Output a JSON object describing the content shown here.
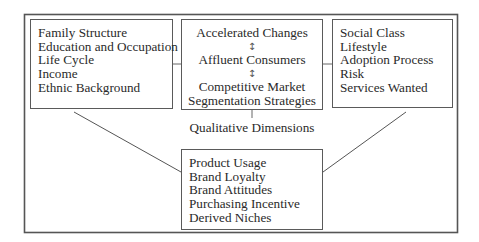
{
  "diagram": {
    "left_box": {
      "items": [
        "Family Structure",
        "Education and Occupation",
        "Life Cycle",
        "Income",
        "Ethnic Background"
      ]
    },
    "center_box": {
      "items": [
        "Accelerated Changes",
        "Affluent Consumers",
        "Competitive Market",
        "Segmentation Strategies"
      ],
      "arrow_glyph": "↕"
    },
    "right_box": {
      "items": [
        "Social Class",
        "Lifestyle",
        "Adoption Process",
        "Risk",
        "Services Wanted"
      ]
    },
    "middle_label": "Qualitative Dimensions",
    "bottom_box": {
      "items": [
        "Product Usage",
        "Brand Loyalty",
        "Brand Attitudes",
        "Purchasing Incentive",
        "Derived Niches"
      ]
    },
    "colors": {
      "line": "#5a5a5a",
      "text": "#2a2a2a",
      "background": "#ffffff"
    }
  }
}
